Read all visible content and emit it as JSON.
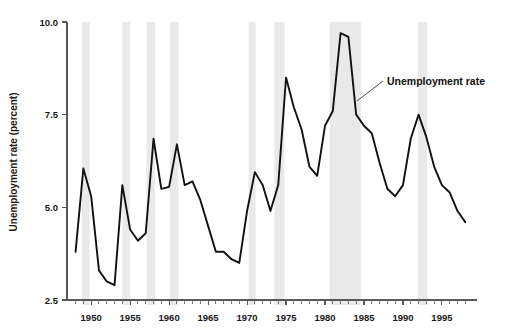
{
  "chart_data": {
    "type": "line",
    "title": "",
    "subtitle": "",
    "xlabel": "",
    "ylabel": "Unemployment rate (percent)",
    "ylim": [
      2.5,
      10.0
    ],
    "xlim": [
      1948,
      1999
    ],
    "grid": false,
    "legend_position": "inline-annotation",
    "y_ticks": [
      "2.5",
      "5.0",
      "7.5",
      "10.0"
    ],
    "y_tick_values": [
      2.5,
      5.0,
      7.5,
      10.0
    ],
    "x_ticks": [
      "1950",
      "1955",
      "1960",
      "1965",
      "1970",
      "1975",
      "1980",
      "1985",
      "1990",
      "1995"
    ],
    "x_tick_values": [
      1950,
      1955,
      1960,
      1965,
      1970,
      1975,
      1980,
      1985,
      1990,
      1995
    ],
    "x_minor_step": 1,
    "series": [
      {
        "name": "Unemployment rate",
        "color": "#111111",
        "x": [
          1948,
          1949,
          1950,
          1951,
          1952,
          1953,
          1954,
          1955,
          1956,
          1957,
          1958,
          1959,
          1960,
          1961,
          1962,
          1963,
          1964,
          1965,
          1966,
          1967,
          1968,
          1969,
          1970,
          1971,
          1972,
          1973,
          1974,
          1975,
          1976,
          1977,
          1978,
          1979,
          1980,
          1981,
          1982,
          1983,
          1984,
          1985,
          1986,
          1987,
          1988,
          1989,
          1990,
          1991,
          1992,
          1993,
          1994,
          1995,
          1996,
          1997,
          1998
        ],
        "values": [
          3.8,
          6.05,
          5.3,
          3.3,
          3.0,
          2.9,
          5.6,
          4.4,
          4.1,
          4.3,
          6.85,
          5.5,
          5.55,
          6.7,
          5.6,
          5.7,
          5.2,
          4.5,
          3.8,
          3.8,
          3.6,
          3.5,
          4.9,
          5.95,
          5.6,
          4.9,
          5.6,
          8.5,
          7.7,
          7.1,
          6.1,
          5.85,
          7.2,
          7.6,
          9.7,
          9.6,
          7.5,
          7.2,
          7.0,
          6.2,
          5.5,
          5.3,
          5.6,
          6.85,
          7.5,
          6.9,
          6.1,
          5.6,
          5.4,
          4.9,
          4.6
        ]
      }
    ],
    "annotations": [
      {
        "text": "Unemployment rate",
        "x_px": 387,
        "y_px": 85,
        "leader_from_px": [
          357,
          101
        ],
        "leader_to_px": [
          383,
          81
        ]
      }
    ],
    "recession_bands": [
      {
        "start": 1948.8,
        "end": 1949.8
      },
      {
        "start": 1954.0,
        "end": 1955.0
      },
      {
        "start": 1957.1,
        "end": 1958.2
      },
      {
        "start": 1960.1,
        "end": 1961.2
      },
      {
        "start": 1970.2,
        "end": 1971.1
      },
      {
        "start": 1973.5,
        "end": 1974.8
      },
      {
        "start": 1980.6,
        "end": 1984.6
      },
      {
        "start": 1991.9,
        "end": 1993.1
      }
    ],
    "band_color": "#e9e9e9"
  },
  "plot_geometry": {
    "x_left_px": 67,
    "x_right_px": 477,
    "y_top_px": 22,
    "y_bottom_px": 300,
    "x_min_year": 1946.9,
    "x_max_year": 1999.5,
    "y_min": 2.5,
    "y_max": 10.0,
    "band_top_px": 22,
    "band_bottom_px": 305,
    "tick_len_major": 5,
    "tick_len_minor": 4
  }
}
